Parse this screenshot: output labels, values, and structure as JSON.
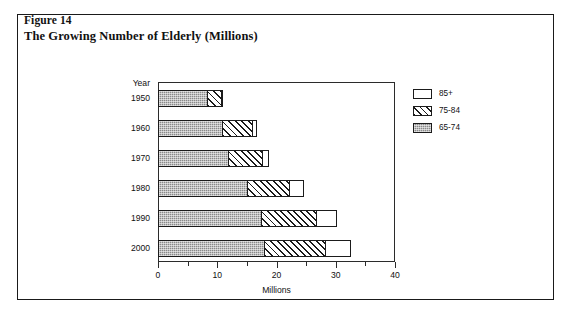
{
  "figure": {
    "label": "Figure 14",
    "title": "The Growing Number of Elderly (Millions)"
  },
  "axes": {
    "y_header": "Year",
    "x_title": "Millions",
    "x_tick_labels": [
      "0",
      "10",
      "20",
      "30",
      "40"
    ]
  },
  "legend": {
    "items": [
      {
        "label": "85+",
        "pattern": "solid-white",
        "color": "#ffffff"
      },
      {
        "label": "75-84",
        "pattern": "diagonal-hatch",
        "color": "#ffffff"
      },
      {
        "label": "65-74",
        "pattern": "gray-stipple",
        "color": "#8a8a8a"
      }
    ]
  },
  "chart_data": {
    "type": "bar",
    "orientation": "horizontal",
    "stacked": true,
    "title": "The Growing Number of Elderly (Millions)",
    "xlabel": "Millions",
    "ylabel": "Year",
    "xlim": [
      0,
      40
    ],
    "major_tick_step": 10,
    "minor_tick_step": 5,
    "grid": false,
    "legend_position": "right",
    "categories": [
      "1950",
      "1960",
      "1970",
      "1980",
      "1990",
      "2000"
    ],
    "series": [
      {
        "name": "65-74",
        "values": [
          8.5,
          11.0,
          12.0,
          15.2,
          17.5,
          18.0
        ]
      },
      {
        "name": "75-84",
        "values": [
          2.5,
          5.3,
          6.0,
          7.3,
          9.5,
          10.5
        ]
      },
      {
        "name": "85+",
        "values": [
          0.4,
          0.8,
          1.1,
          2.5,
          3.5,
          4.5
        ]
      }
    ],
    "totals": [
      11.4,
      17.1,
      19.1,
      25.0,
      30.5,
      33.0
    ]
  }
}
